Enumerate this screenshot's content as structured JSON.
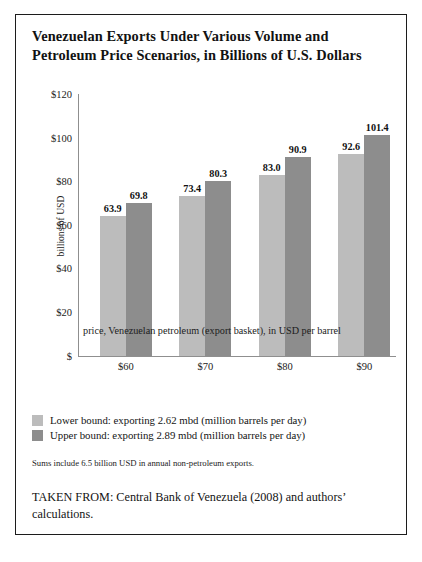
{
  "figure": {
    "title": "Venezuelan Exports Under Various Volume and Petroleum Price Scenarios, in Billions of U.S. Dollars",
    "sums_note": "Sums include 6.5 billion USD in annual non-petroleum exports.",
    "source_note": "TAKEN FROM: Central Bank of Venezuela (2008) and authors’ calculations."
  },
  "colors": {
    "lower_bound": "#bcbcbc",
    "upper_bound": "#8d8d8d",
    "axis": "#8f8f8f",
    "frame": "#1c1c1c",
    "text": "#121212"
  },
  "chart_data": {
    "type": "bar",
    "title": "Venezuelan Exports Under Various Volume and Petroleum Price Scenarios, in Billions of U.S. Dollars",
    "xlabel": "price, Venezuelan petroleum (export basket), in USD per barrel",
    "ylabel": "billions of USD",
    "categories": [
      "$60",
      "$70",
      "$80",
      "$90"
    ],
    "series": [
      {
        "name": "Lower bound: exporting 2.62 mbd (million barrels per day)",
        "color": "#bcbcbc",
        "values": [
          63.9,
          69.8,
          73.4,
          80.3
        ]
      },
      {
        "name": "Upper bound: exporting 2.89 mbd (million barrels per day)",
        "color": "#8d8d8d",
        "values": [
          69.8,
          80.3,
          90.9,
          101.4
        ]
      }
    ],
    "groups": [
      {
        "category": "$60",
        "lower": 63.9,
        "upper": 69.8
      },
      {
        "category": "$70",
        "lower": 73.4,
        "upper": 80.3
      },
      {
        "category": "$80",
        "lower": 83.0,
        "upper": 90.9
      },
      {
        "category": "$90",
        "lower": 92.6,
        "upper": 101.4
      }
    ],
    "ylim": [
      0,
      120
    ],
    "yticks": [
      "$",
      "$20",
      "$40",
      "$60",
      "$80",
      "$100",
      "$120"
    ],
    "ytick_values": [
      0,
      20,
      40,
      60,
      80,
      100,
      120
    ],
    "grid": false,
    "legend_position": "below-plot"
  },
  "legend": [
    {
      "label": "Lower bound: exporting 2.62 mbd (million barrels per day)",
      "color": "#bcbcbc"
    },
    {
      "label": "Upper bound: exporting 2.89 mbd (million barrels per day)",
      "color": "#8d8d8d"
    }
  ]
}
